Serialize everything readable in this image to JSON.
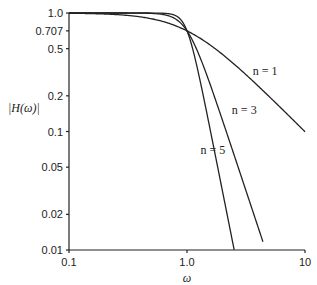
{
  "chart_data": {
    "type": "line",
    "title": "",
    "xlabel": "ω",
    "ylabel": "|H(ω)|",
    "xscale": "log",
    "yscale": "log",
    "xlim": [
      0.1,
      10
    ],
    "ylim": [
      0.01,
      1.0
    ],
    "grid": false,
    "xticks": [
      {
        "value": 0.1,
        "label": "0.1"
      },
      {
        "value": 1.0,
        "label": "1.0"
      },
      {
        "value": 10,
        "label": "10"
      }
    ],
    "yticks": [
      {
        "value": 1.0,
        "label": "1.0"
      },
      {
        "value": 0.707,
        "label": "0.707"
      },
      {
        "value": 0.5,
        "label": "0.5"
      },
      {
        "value": 0.2,
        "label": "0.2"
      },
      {
        "value": 0.1,
        "label": "0.1"
      },
      {
        "value": 0.05,
        "label": "0.05"
      },
      {
        "value": 0.02,
        "label": "0.02"
      },
      {
        "value": 0.01,
        "label": "0.01"
      }
    ],
    "series": [
      {
        "name": "n = 1",
        "order": 1,
        "formula": "1/sqrt(1+ω^(2n))",
        "x_end": 10,
        "label_at": [
          3.6,
          0.3
        ]
      },
      {
        "name": "n = 3",
        "order": 3,
        "formula": "1/sqrt(1+ω^(2n))",
        "x_end": 4.4,
        "label_at": [
          2.4,
          0.14
        ]
      },
      {
        "name": "n = 5",
        "order": 5,
        "formula": "1/sqrt(1+ω^(2n))",
        "x_end": 2.51,
        "label_at": [
          1.3,
          0.065
        ]
      }
    ]
  }
}
